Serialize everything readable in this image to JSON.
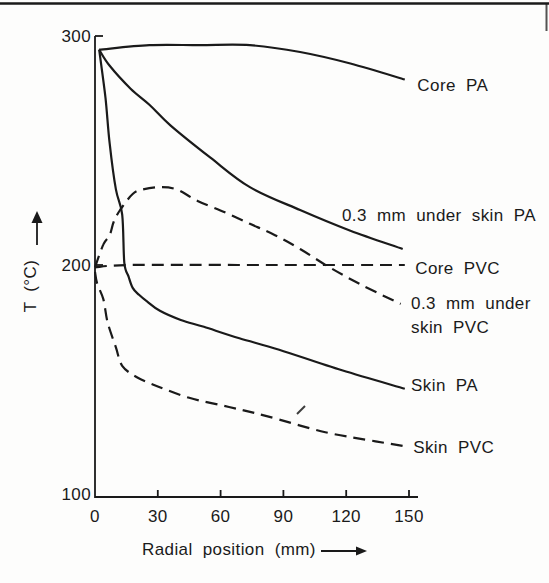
{
  "figure": {
    "kind": "scanned line chart",
    "ink_color": "#1a1a1a",
    "paper_color": "#fdfdfc"
  },
  "chart_data": {
    "type": "line",
    "title": "",
    "xlabel": "Radial position (mm)",
    "ylabel": "T (°C)",
    "xlim": [
      0,
      150
    ],
    "ylim": [
      100,
      300
    ],
    "x_ticks": [
      0,
      30,
      60,
      90,
      120,
      150
    ],
    "x_tick_labels": [
      "0",
      "30",
      "60",
      "90",
      "120",
      "150"
    ],
    "y_ticks": [
      100,
      200,
      300
    ],
    "y_tick_labels": [
      "100",
      "200",
      "300"
    ],
    "grid": false,
    "legend_position": "labels at right end of each curve",
    "series": [
      {
        "name": "Core PA",
        "style": "solid",
        "label_lines": [
          "Core PA"
        ],
        "label_at": [
          154,
          276
        ],
        "points": [
          [
            2,
            294
          ],
          [
            26,
            296
          ],
          [
            50,
            296
          ],
          [
            74,
            296
          ],
          [
            98,
            293
          ],
          [
            122,
            288
          ],
          [
            148,
            281
          ]
        ]
      },
      {
        "name": "0.3 mm under skin PA",
        "style": "solid",
        "label_lines": [
          "0.3 mm under skin PA"
        ],
        "label_at": [
          118,
          219
        ],
        "points": [
          [
            2,
            294
          ],
          [
            7,
            287
          ],
          [
            17,
            277
          ],
          [
            26,
            270
          ],
          [
            36,
            261
          ],
          [
            55,
            247
          ],
          [
            74,
            234
          ],
          [
            98,
            224
          ],
          [
            122,
            215
          ],
          [
            147,
            207
          ]
        ]
      },
      {
        "name": "Core PVC",
        "style": "dashed",
        "label_lines": [
          "Core PVC"
        ],
        "label_at": [
          153,
          196
        ],
        "points": [
          [
            0,
            199
          ],
          [
            17,
            200
          ],
          [
            74,
            200
          ],
          [
            148,
            200
          ]
        ]
      },
      {
        "name": "0.3 mm under skin PVC",
        "style": "dashed",
        "label_lines": [
          "0.3 mm under",
          "skin PVC"
        ],
        "label_at": [
          151,
          181
        ],
        "points": [
          [
            0,
            199
          ],
          [
            4,
            209
          ],
          [
            7,
            213
          ],
          [
            9,
            219
          ],
          [
            12,
            224
          ],
          [
            18,
            231
          ],
          [
            23,
            233
          ],
          [
            31,
            234
          ],
          [
            39,
            233
          ],
          [
            49,
            228
          ],
          [
            62,
            223
          ],
          [
            74,
            218
          ],
          [
            86,
            213
          ],
          [
            98,
            207
          ],
          [
            112,
            199
          ],
          [
            128,
            191
          ],
          [
            146,
            183
          ]
        ]
      },
      {
        "name": "Skin PA",
        "style": "solid",
        "label_lines": [
          "Skin PA"
        ],
        "label_at": [
          151,
          145
        ],
        "points": [
          [
            2,
            294
          ],
          [
            5,
            273
          ],
          [
            7,
            253
          ],
          [
            10,
            233
          ],
          [
            13,
            222
          ],
          [
            14,
            201
          ],
          [
            16,
            195
          ],
          [
            18,
            190
          ],
          [
            21,
            187
          ],
          [
            25,
            184
          ],
          [
            31,
            180
          ],
          [
            41,
            176
          ],
          [
            52,
            173
          ],
          [
            69,
            168
          ],
          [
            88,
            163
          ],
          [
            118,
            154
          ],
          [
            148,
            146
          ]
        ]
      },
      {
        "name": "Skin PVC",
        "style": "dashed",
        "label_lines": [
          "Skin PVC"
        ],
        "label_at": [
          152,
          118
        ],
        "points": [
          [
            0,
            197
          ],
          [
            1,
            192
          ],
          [
            4,
            185
          ],
          [
            6,
            175
          ],
          [
            10,
            164
          ],
          [
            13,
            156
          ],
          [
            20,
            151
          ],
          [
            30,
            147
          ],
          [
            45,
            142
          ],
          [
            64,
            138
          ],
          [
            82,
            134
          ],
          [
            110,
            127
          ],
          [
            134,
            123
          ],
          [
            147,
            121
          ]
        ]
      }
    ]
  }
}
